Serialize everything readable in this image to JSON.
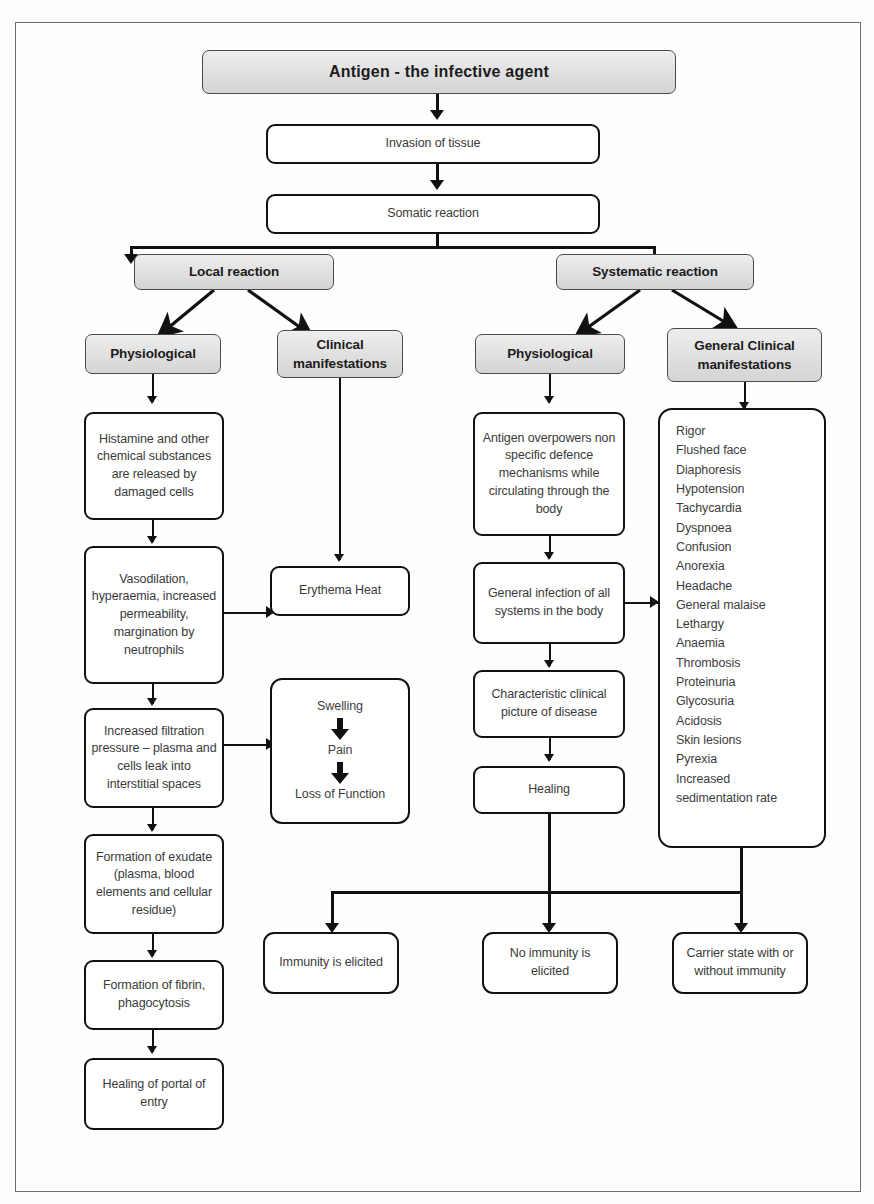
{
  "diagram": {
    "title": "Antigen - the infective agent",
    "nodes": {
      "antigen": "Antigen - the infective agent",
      "invasion": "Invasion of tissue",
      "somatic": "Somatic reaction",
      "local_reaction": "Local reaction",
      "systematic_reaction": "Systematic reaction",
      "local_physiological": "Physiological",
      "clinical_manifestations": "Clinical manifestations",
      "systemic_physiological": "Physiological",
      "general_clinical_manifestations": "General Clinical manifestations",
      "histamine": "Histamine and other chemical substances are released by damaged cells",
      "vasodilation": "Vasodilation, hyperaemia, increased permeability, margination by neutrophils",
      "filtration": "Increased filtration pressure – plasma and cells leak into interstitial spaces",
      "exudate": "Formation of exudate (plasma, blood elements and cellular residue)",
      "fibrin": "Formation of fibrin, phagocytosis",
      "healing_portal": "Healing of portal of entry",
      "erythema": "Erythema Heat",
      "swelling": "Swelling",
      "pain": "Pain",
      "loss_of_function": "Loss of Function",
      "antigen_overpowers": "Antigen overpowers non specific defence mechanisms while circulating through the body",
      "general_infection": "General infection of all systems in the body",
      "characteristic_picture": "Characteristic clinical picture of disease",
      "healing": "Healing",
      "immunity_elicited": "Immunity is elicited",
      "no_immunity_elicited": "No immunity is elicited",
      "carrier_state": "Carrier state with or without immunity"
    },
    "symptoms": [
      "Rigor",
      "Flushed face",
      "Diaphoresis",
      "Hypotension",
      "Tachycardia",
      "Dyspnoea",
      "Confusion",
      "Anorexia",
      "Headache",
      "General malaise",
      "Lethargy",
      "Anaemia",
      "Thrombosis",
      "Proteinuria",
      "Glycosuria",
      "Acidosis",
      "Skin lesions",
      "Pyrexia",
      "Increased sedimentation rate"
    ],
    "colors": {
      "shaded_fill": "#e2e2e2",
      "box_border": "#111111",
      "connector": "#111111",
      "text": "#3a3a3a",
      "page_frame": "#6d6d6d"
    }
  }
}
